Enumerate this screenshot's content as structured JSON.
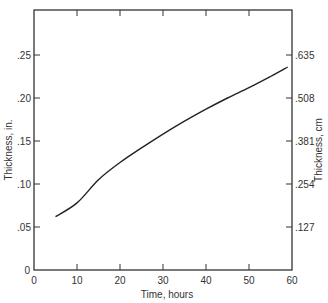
{
  "chart_data": {
    "type": "line",
    "title": "",
    "xlabel": "Time, hours",
    "ylabel": "Thickness, in.",
    "ylabel_right": "Thickness, cm",
    "xlim": [
      0,
      60
    ],
    "ylim": [
      0,
      0.3
    ],
    "x_ticks": [
      0,
      10,
      20,
      30,
      40,
      50,
      60
    ],
    "x_tick_labels": [
      "0",
      "10",
      "20",
      "30",
      "40",
      "50",
      "60"
    ],
    "y_ticks": [
      0,
      0.05,
      0.1,
      0.15,
      0.2,
      0.25
    ],
    "y_tick_labels": [
      "0",
      ".05",
      ".10",
      ".15",
      ".20",
      ".25"
    ],
    "y_right_ticks": [
      0.05,
      0.1,
      0.15,
      0.2,
      0.25
    ],
    "y_right_tick_labels": [
      ".127",
      ".254",
      ".381",
      ".508",
      ".635"
    ],
    "grid": false,
    "legend": null,
    "series": [
      {
        "name": "Thickness",
        "x": [
          5,
          10,
          15,
          20,
          25,
          30,
          35,
          40,
          45,
          50,
          55,
          59
        ],
        "y": [
          0.062,
          0.078,
          0.105,
          0.125,
          0.142,
          0.158,
          0.173,
          0.187,
          0.2,
          0.212,
          0.225,
          0.236
        ]
      }
    ]
  },
  "colors": {
    "axis": "#333333",
    "line": "#222222",
    "background": "#ffffff"
  }
}
